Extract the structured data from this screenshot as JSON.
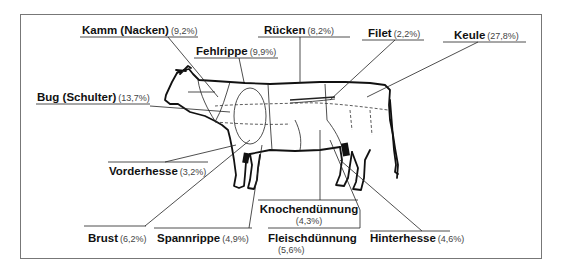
{
  "diagram": {
    "type": "beef-cuts-diagram",
    "language": "de",
    "labels": [
      {
        "id": "kamm",
        "name": "Kamm (Nacken)",
        "percent": "(9,2%)"
      },
      {
        "id": "fehlrippe",
        "name": "Fehlrippe",
        "percent": "(9,9%)"
      },
      {
        "id": "ruecken",
        "name": "Rücken",
        "percent": "(8,2%)"
      },
      {
        "id": "filet",
        "name": "Filet",
        "percent": "(2,2%)"
      },
      {
        "id": "keule",
        "name": "Keule",
        "percent": "(27,8%)"
      },
      {
        "id": "bug",
        "name": "Bug (Schulter)",
        "percent": "(13,7%)"
      },
      {
        "id": "vorderhesse",
        "name": "Vorderhesse",
        "percent": "(3,2%)"
      },
      {
        "id": "knochenduennung",
        "name": "Knochendünnung",
        "percent": "(4,3%)"
      },
      {
        "id": "brust",
        "name": "Brust",
        "percent": "(6,2%)"
      },
      {
        "id": "spannrippe",
        "name": "Spannrippe",
        "percent": "(4,9%)"
      },
      {
        "id": "fleischduennung",
        "name": "Fleischdünnung",
        "percent": "(5,6%)"
      },
      {
        "id": "hinterhesse",
        "name": "Hinterhesse",
        "percent": "(4,6%)"
      }
    ]
  }
}
